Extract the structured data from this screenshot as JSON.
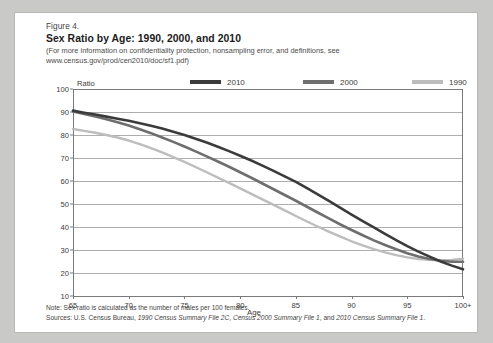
{
  "figure": {
    "number": "Figure 4.",
    "title": "Sex Ratio by Age: 1990, 2000, and 2010",
    "subtitle_line1": "(For more information on confidentiality protection, nonsampling error, and definitions, see",
    "subtitle_line2": "www.census.gov/prod/cen2010/doc/sf1.pdf)",
    "note": "Note: Sex ratio is calculated as the number of males per 100 females.",
    "sources_prefix": "Sources: U.S. Census Bureau, ",
    "sources_i1": "1990 Census Summary File 2C",
    "sources_mid1": ", ",
    "sources_i2": "Census 2000 Summary File 1",
    "sources_mid2": ", and ",
    "sources_i3": "2010 Census Summary File 1",
    "sources_suffix": "."
  },
  "colors": {
    "series_2010": "#3b3b3b",
    "series_2000": "#6e6e6e",
    "series_1990": "#bdbdbd",
    "gridline": "#aeaeae",
    "frame": "#7a7a7a",
    "card_bg": "#ffffff",
    "page_bg": "#c9c9c7"
  },
  "chart_data": {
    "type": "line",
    "title": "Sex Ratio by Age: 1990, 2000, and 2010",
    "xlabel": "Age",
    "ylabel": "Ratio",
    "ylim": [
      10,
      100
    ],
    "ytick_values": [
      10,
      20,
      30,
      40,
      50,
      60,
      70,
      80,
      90,
      100
    ],
    "ytick_labels": [
      "10",
      "20",
      "30",
      "40",
      "50",
      "60",
      "70",
      "80",
      "90",
      "100"
    ],
    "xlim": [
      65,
      100
    ],
    "xtick_values": [
      65,
      70,
      75,
      80,
      85,
      90,
      95,
      100
    ],
    "xtick_labels": [
      "65",
      "70",
      "75",
      "80",
      "85",
      "90",
      "95",
      "100+"
    ],
    "grid": "horizontal",
    "legend_position": "top-right",
    "x": [
      65,
      66,
      67,
      68,
      69,
      70,
      71,
      72,
      73,
      74,
      75,
      76,
      77,
      78,
      79,
      80,
      81,
      82,
      83,
      84,
      85,
      86,
      87,
      88,
      89,
      90,
      91,
      92,
      93,
      94,
      95,
      96,
      97,
      98,
      99,
      100
    ],
    "series": [
      {
        "name": "2010",
        "color": "#3b3b3b",
        "values": [
          90.6,
          89.7,
          88.9,
          88.0,
          87.1,
          86.2,
          85.1,
          84.0,
          82.8,
          81.4,
          80.0,
          78.4,
          76.7,
          74.9,
          73.0,
          71.0,
          68.9,
          66.7,
          64.4,
          62.0,
          59.6,
          56.9,
          54.1,
          51.2,
          48.3,
          45.4,
          42.6,
          39.8,
          37.0,
          34.3,
          31.7,
          29.3,
          27.1,
          25.0,
          23.2,
          21.6
        ]
      },
      {
        "name": "2000",
        "color": "#6e6e6e",
        "values": [
          90.2,
          89.1,
          88.0,
          86.8,
          85.5,
          84.1,
          82.5,
          80.8,
          78.9,
          77.0,
          75.0,
          72.9,
          70.7,
          68.5,
          66.2,
          63.8,
          61.4,
          58.9,
          56.4,
          53.9,
          51.4,
          48.8,
          46.2,
          43.6,
          41.1,
          38.7,
          36.4,
          34.2,
          32.2,
          30.3,
          28.6,
          27.2,
          26.1,
          25.3,
          24.9,
          24.9
        ]
      },
      {
        "name": "1990",
        "color": "#bdbdbd",
        "values": [
          82.6,
          81.8,
          81.0,
          80.0,
          78.9,
          77.6,
          76.0,
          74.3,
          72.4,
          70.4,
          68.3,
          66.1,
          63.8,
          61.5,
          59.2,
          56.8,
          54.4,
          52.0,
          49.6,
          47.2,
          44.8,
          42.4,
          40.1,
          37.9,
          35.8,
          33.8,
          32.0,
          30.4,
          29.0,
          27.8,
          26.8,
          26.1,
          25.7,
          25.5,
          25.7,
          26.2
        ]
      }
    ],
    "legend": [
      {
        "label": "2010",
        "color": "#3b3b3b"
      },
      {
        "label": "2000",
        "color": "#6e6e6e"
      },
      {
        "label": "1990",
        "color": "#bdbdbd"
      }
    ]
  }
}
